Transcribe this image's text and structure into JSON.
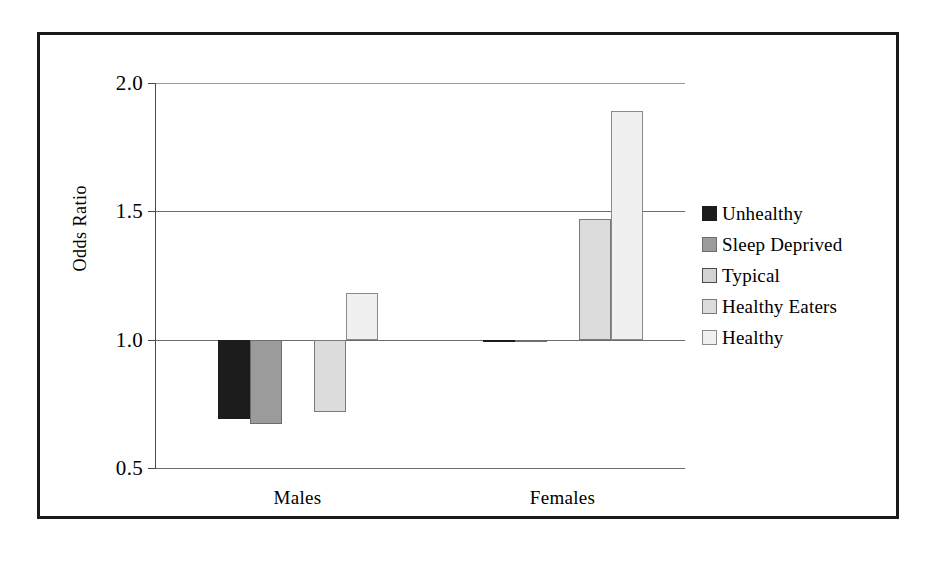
{
  "chart_data": {
    "type": "bar",
    "title": "",
    "subtitle": "",
    "xlabel": "",
    "ylabel": "Odds Ratio",
    "categories": [
      "Males",
      "Females"
    ],
    "ylim": [
      0.5,
      2.0
    ],
    "yticks": [
      "0.5",
      "1.0",
      "1.5",
      "2.0"
    ],
    "ytick_values": [
      0.5,
      1.0,
      1.5,
      2.0
    ],
    "grid": true,
    "grid_axis": "y",
    "reference_line": 1.0,
    "legend_position": "right",
    "series": [
      {
        "name": "Unhealthy",
        "color": "#1c1c1c",
        "border": "#1c1c1c",
        "values": [
          0.69,
          0.99
        ]
      },
      {
        "name": "Sleep Deprived",
        "color": "#9b9b9b",
        "border": "#6d6d6d",
        "values": [
          0.67,
          0.99
        ]
      },
      {
        "name": "Typical",
        "color": "#d2d2d2",
        "border": "#4a4a4a",
        "values": [
          1.0,
          1.0
        ]
      },
      {
        "name": "Healthy Eaters",
        "color": "#dcdcdc",
        "border": "#7a7a7a",
        "values": [
          0.72,
          1.47
        ]
      },
      {
        "name": "Healthy",
        "color": "#f0f0f0",
        "border": "#8a8a8a",
        "values": [
          1.18,
          1.89
        ]
      }
    ]
  }
}
